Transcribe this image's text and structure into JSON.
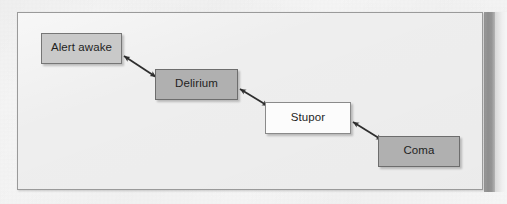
{
  "figure": {
    "type": "flow-diagram",
    "orientation": "descending-staircase",
    "background_color": "#eeeeee",
    "frame_border_color": "#9a9a9a",
    "page_background_color": "#f6f6f6",
    "gutter_shadow_color": "#939393"
  },
  "nodes": [
    {
      "id": "alert-awake",
      "label": "Alert awake",
      "x": 41,
      "y": 33,
      "w": 81,
      "h": 31,
      "fill": "#c9c9c9",
      "border": "#767676",
      "text_color": "#1f1f1f"
    },
    {
      "id": "delirium",
      "label": "Delirium",
      "x": 155,
      "y": 69,
      "w": 83,
      "h": 31,
      "fill": "#b0b0b0",
      "border": "#6d6d6d",
      "text_color": "#1f1f1f"
    },
    {
      "id": "stupor",
      "label": "Stupor",
      "x": 265,
      "y": 102,
      "w": 86,
      "h": 32,
      "fill": "#fcfcfc",
      "border": "#8a8a8a",
      "text_color": "#1f1f1f"
    },
    {
      "id": "coma",
      "label": "Coma",
      "x": 378,
      "y": 136,
      "w": 82,
      "h": 31,
      "fill": "#b0b0b0",
      "border": "#6d6d6d",
      "text_color": "#1f1f1f"
    }
  ],
  "connectors": [
    {
      "id": "alert-awake--delirium",
      "from": "alert-awake",
      "to": "delirium",
      "style": "double-headed-arrow",
      "color": "#2e2e2e",
      "x1": 124,
      "y1": 56,
      "x2": 156,
      "y2": 77
    },
    {
      "id": "delirium--stupor",
      "from": "delirium",
      "to": "stupor",
      "style": "double-headed-arrow",
      "color": "#2e2e2e",
      "x1": 240,
      "y1": 89,
      "x2": 268,
      "y2": 106
    },
    {
      "id": "stupor--coma",
      "from": "stupor",
      "to": "coma",
      "style": "double-headed-arrow",
      "color": "#2e2e2e",
      "x1": 353,
      "y1": 122,
      "x2": 382,
      "y2": 140
    }
  ],
  "bleed_through": [
    {
      "text": "sensorium deterioration",
      "x": 62,
      "y": 118,
      "rotate": -0.4
    },
    {
      "text": "consciousness levels",
      "x": 300,
      "y": 96,
      "rotate": 0.3
    },
    {
      "text": "altered mental status",
      "x": 96,
      "y": 150,
      "rotate": -0.2
    },
    {
      "text": "assessment scale",
      "x": 318,
      "y": 166,
      "rotate": 0.2
    },
    {
      "text": "clinical staging",
      "x": 198,
      "y": 32,
      "rotate": 0.3
    }
  ]
}
